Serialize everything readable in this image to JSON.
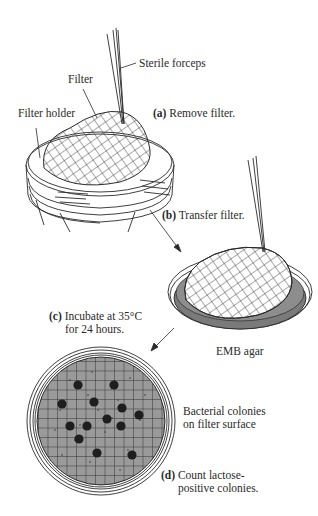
{
  "diagram": {
    "type": "process-flow",
    "colors": {
      "line": "#2a2a2a",
      "agar": "#7a7a7a",
      "filter_surface": "#9a9a9a",
      "colony": "#1e1e1e",
      "background": "#ffffff"
    },
    "labels": {
      "sterile_forceps": "Sterile forceps",
      "filter": "Filter",
      "filter_holder": "Filter holder",
      "emb_agar": "EMB agar",
      "bacterial_colonies_line1": "Bacterial colonies",
      "bacterial_colonies_line2": "on filter surface"
    },
    "steps": [
      {
        "letter": "(a)",
        "text": "Remove filter."
      },
      {
        "letter": "(b)",
        "text": "Transfer filter."
      },
      {
        "letter": "(c)",
        "text_line1": "Incubate at 35°C",
        "text_line2": "for 24 hours."
      },
      {
        "letter": "(d)",
        "text_line1": "Count lactose-",
        "text_line2": "positive colonies."
      }
    ],
    "colony_count": 14
  }
}
